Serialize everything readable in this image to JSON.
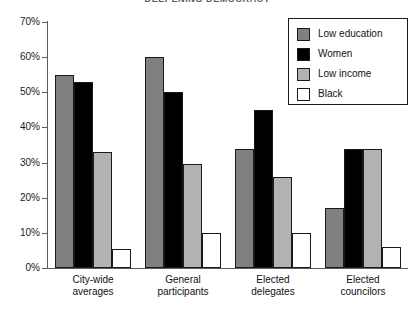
{
  "running_head": {
    "folio": "",
    "title": "DEEPENING DEMOCRACY"
  },
  "legend": {
    "items": [
      {
        "label": "Low education",
        "color": "#808080",
        "swatch_name": "legend-swatch-low-education"
      },
      {
        "label": "Women",
        "color": "#000000",
        "swatch_name": "legend-swatch-women"
      },
      {
        "label": "Low income",
        "color": "#b2b2b2",
        "swatch_name": "legend-swatch-low-income"
      },
      {
        "label": "Black",
        "color": "#ffffff",
        "swatch_name": "legend-swatch-black"
      }
    ]
  },
  "axis": {
    "y_ticks": [
      "0%",
      "10%",
      "20%",
      "30%",
      "40%",
      "50%",
      "60%",
      "70%"
    ],
    "y_tick_values": [
      0,
      10,
      20,
      30,
      40,
      50,
      60,
      70
    ]
  },
  "categories_wrapped": [
    {
      "line1": "City-wide",
      "line2": "averages"
    },
    {
      "line1": "General",
      "line2": "participants"
    },
    {
      "line1": "Elected",
      "line2": "delegates"
    },
    {
      "line1": "Elected",
      "line2": "councilors"
    }
  ],
  "chart_data": {
    "type": "bar",
    "title": "",
    "xlabel": "",
    "ylabel": "",
    "ylim": [
      0,
      70
    ],
    "ytick_step": 10,
    "grid": false,
    "legend_position": "top-right",
    "categories": [
      "City-wide averages",
      "General participants",
      "Elected delegates",
      "Elected councilors"
    ],
    "series": [
      {
        "name": "Low education",
        "color": "#808080",
        "values": [
          55,
          60,
          34,
          17
        ]
      },
      {
        "name": "Women",
        "color": "#000000",
        "values": [
          53,
          50,
          45,
          34
        ]
      },
      {
        "name": "Low income",
        "color": "#b2b2b2",
        "values": [
          33,
          29.5,
          26,
          34
        ]
      },
      {
        "name": "Black",
        "color": "#ffffff",
        "values": [
          5.5,
          10,
          10,
          6
        ]
      }
    ]
  }
}
